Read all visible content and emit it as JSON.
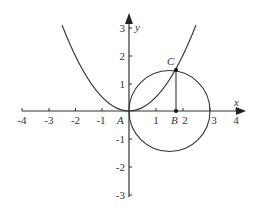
{
  "figure": {
    "axes": {
      "x_label": "x",
      "y_label": "y",
      "x_ticks": [
        "-4",
        "-3",
        "-2",
        "-1",
        "1",
        "2",
        "3",
        "4"
      ],
      "y_ticks": [
        "3",
        "2",
        "1",
        "-1",
        "-2",
        "-3"
      ],
      "xlim": [
        -4,
        4
      ],
      "ylim": [
        -3,
        3.3
      ]
    },
    "points": {
      "A": "A",
      "B": "B",
      "C": "C"
    },
    "curves": {
      "parabola": "y = x^2 / 2",
      "circle": "center (1.5, 0), radius 1.5"
    },
    "colors": {
      "stroke": "#333333",
      "background": "#ffffff"
    }
  }
}
